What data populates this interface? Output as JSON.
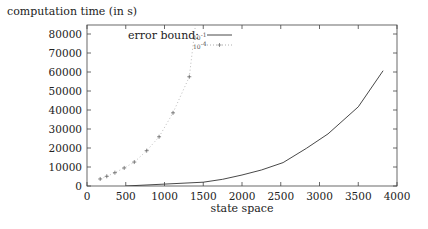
{
  "chart_data": {
    "type": "line",
    "title": "",
    "ylabel": "computation time (in s)",
    "xlabel": "state space",
    "xlim": [
      0,
      4000
    ],
    "ylim": [
      0,
      85000
    ],
    "x_ticks": [
      0,
      500,
      1000,
      1500,
      2000,
      2500,
      3000,
      3500,
      4000
    ],
    "y_ticks": [
      0,
      10000,
      20000,
      30000,
      40000,
      50000,
      60000,
      70000,
      80000
    ],
    "grid": false,
    "legend": {
      "title": "error bound:",
      "position": "top-left-inside",
      "entries": [
        {
          "label": "10^-1",
          "label_base": "10",
          "label_exp": "-1",
          "style": "solid"
        },
        {
          "label": "10^-4",
          "label_base": "10",
          "label_exp": "-4",
          "style": "dotted-plus"
        }
      ]
    },
    "series": [
      {
        "name": "10^-1",
        "style": "solid",
        "color": "#333333",
        "x": [
          500,
          1000,
          1500,
          1750,
          2000,
          2250,
          2530,
          2830,
          3110,
          3500,
          3820
        ],
        "y": [
          0,
          1000,
          2000,
          3500,
          5800,
          8400,
          12300,
          19800,
          27400,
          41700,
          60700
        ]
      },
      {
        "name": "10^-4",
        "style": "dotted-plus",
        "color": "#888888",
        "x": [
          170,
          255,
          360,
          480,
          610,
          770,
          930,
          1110,
          1320,
          1400
        ],
        "y": [
          3700,
          5100,
          7000,
          9500,
          12600,
          18600,
          25900,
          38500,
          57500,
          85000
        ]
      }
    ]
  }
}
